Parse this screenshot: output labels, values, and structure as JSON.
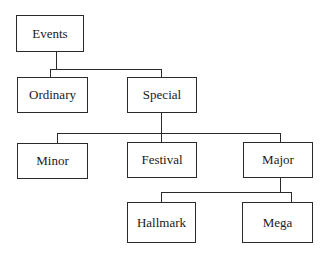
{
  "diagram": {
    "type": "hierarchy-tree",
    "root": "Events",
    "nodes": {
      "events": "Events",
      "ordinary": "Ordinary",
      "special": "Special",
      "minor": "Minor",
      "festival": "Festival",
      "major": "Major",
      "hallmark": "Hallmark",
      "mega": "Mega"
    },
    "edges": [
      [
        "Events",
        "Ordinary"
      ],
      [
        "Events",
        "Special"
      ],
      [
        "Special",
        "Minor"
      ],
      [
        "Special",
        "Festival"
      ],
      [
        "Special",
        "Major"
      ],
      [
        "Major",
        "Hallmark"
      ],
      [
        "Major",
        "Mega"
      ]
    ],
    "colors": {
      "line": "#2a2a2a",
      "box_fill": "#ffffff",
      "text": "#1a1a1a"
    }
  }
}
